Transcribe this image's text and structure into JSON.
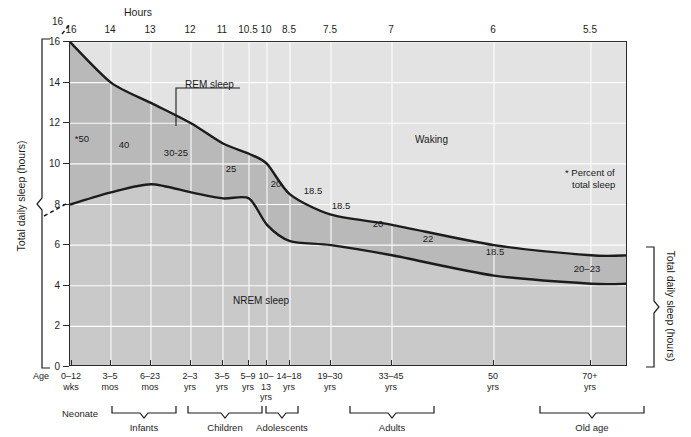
{
  "figure": {
    "top_axis_title": "Hours",
    "left_axis_title": "Total daily sleep (hours)",
    "right_axis_title": "Total daily sleep (hours)",
    "bottom_axis_title": "Age",
    "footnote": "* Percent of\ntotal sleep",
    "footnote_line1": "* Percent of",
    "footnote_line2": "total sleep",
    "colors": {
      "waking_fill": "#e3e3e3",
      "rem_fill": "#b9b9b9",
      "nrem_fill": "#c9c9c9",
      "curve_stroke": "#1c1c1c",
      "gridline": "#ffffff",
      "frame": "#2b2b2b"
    }
  },
  "chart_data": {
    "type": "area",
    "xlabel": "Age",
    "ylabel": "Total daily sleep (hours)",
    "ylim": [
      0,
      16
    ],
    "yticks": [
      0,
      2,
      4,
      6,
      8,
      10,
      12,
      14,
      16
    ],
    "grid": true,
    "legend": "in-plot labels",
    "top_axis_label": "Hours",
    "top_axis_ticks": [
      "16",
      "14",
      "13",
      "12",
      "11",
      "10.5",
      "10",
      "8.5",
      "7.5",
      "7",
      "6",
      "5.5"
    ],
    "x_categories": [
      {
        "line1": "0–12",
        "line2": "wks"
      },
      {
        "line1": "3–5",
        "line2": "mos"
      },
      {
        "line1": "6–23",
        "line2": "mos"
      },
      {
        "line1": "2–3",
        "line2": "yrs"
      },
      {
        "line1": "3–5",
        "line2": "yrs"
      },
      {
        "line1": "5–9",
        "line2": "yrs"
      },
      {
        "line1": "10–",
        "line2": "13",
        "line3": "yrs"
      },
      {
        "line1": "14–18",
        "line2": "yrs"
      },
      {
        "line1": "19–30",
        "line2": "yrs"
      },
      {
        "line1": "33–45",
        "line2": "yrs"
      },
      {
        "line1": "50",
        "line2": "yrs"
      },
      {
        "line1": "70+",
        "line2": "yrs"
      }
    ],
    "series": [
      {
        "name": "Total sleep (top of REM band)",
        "values": [
          16,
          14,
          13,
          12,
          11,
          10.5,
          10,
          8.5,
          7.5,
          7,
          6,
          5.5
        ]
      },
      {
        "name": "NREM sleep (bottom of REM band)",
        "values": [
          8.0,
          8.6,
          9.0,
          8.6,
          8.3,
          8.3,
          7.0,
          6.2,
          6.0,
          5.5,
          4.5,
          4.1
        ]
      }
    ],
    "regions": [
      {
        "name": "Waking",
        "label": "Waking"
      },
      {
        "name": "REM sleep",
        "label": "REM sleep"
      },
      {
        "name": "NREM sleep",
        "label": "NREM sleep"
      }
    ],
    "rem_percent_labels": [
      {
        "text": "*50",
        "x_hint": "0–12 wks"
      },
      {
        "text": "40",
        "x_hint": "3–5 mos"
      },
      {
        "text": "30-25",
        "x_hint": "6–23 mos"
      },
      {
        "text": "25",
        "x_hint": "2–3 yrs"
      },
      {
        "text": "20",
        "x_hint": "3–5 yrs"
      },
      {
        "text": "18.5",
        "x_hint": "5–9 yrs"
      },
      {
        "text": "18.5",
        "x_hint": "10–13 yrs"
      },
      {
        "text": "20",
        "x_hint": "14–18 yrs"
      },
      {
        "text": "22",
        "x_hint": "19–30 yrs"
      },
      {
        "text": "18.5",
        "x_hint": "33–45 yrs"
      },
      {
        "text": "20–23",
        "x_hint": "50–70+ yrs"
      }
    ],
    "annotations": [
      {
        "text": "REM sleep",
        "type": "leader-line"
      },
      {
        "text": "Waking",
        "type": "region-label"
      },
      {
        "text": "NREM sleep",
        "type": "region-label"
      },
      {
        "text": "* Percent of total sleep",
        "type": "footnote"
      }
    ]
  },
  "labels": {
    "rem_sleep": "REM sleep",
    "waking": "Waking",
    "nrem_sleep": "NREM sleep",
    "pct_50": "*50",
    "pct_40": "40",
    "pct_30_25": "30-25",
    "pct_25": "25",
    "pct_20_a": "20",
    "pct_18_5_a": "18.5",
    "pct_18_5_b": "18.5",
    "pct_20_b": "20",
    "pct_22": "22",
    "pct_18_5_c": "18.5",
    "pct_20_23": "20–23"
  },
  "y_ticks": [
    "16",
    "14",
    "12",
    "10",
    "8",
    "6",
    "4",
    "2",
    "0"
  ],
  "y_break_top": "16",
  "y_break_bottom": "8",
  "life_stages": [
    {
      "label": "Neonate",
      "bracket": false
    },
    {
      "label": "Infants",
      "bracket": true
    },
    {
      "label": "Children",
      "bracket": true
    },
    {
      "label": "Adolescents",
      "bracket": true
    },
    {
      "label": "Adults",
      "bracket": true
    },
    {
      "label": "Old age",
      "bracket": true
    }
  ]
}
